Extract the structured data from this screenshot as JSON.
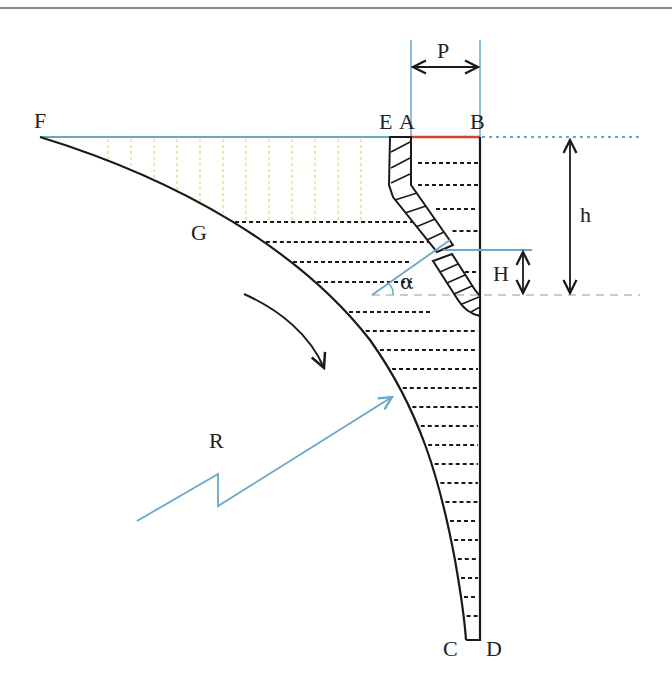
{
  "diagram": {
    "type": "engineering-cross-section",
    "labels": {
      "F": "F",
      "E": "E",
      "A": "A",
      "B": "B",
      "G": "G",
      "C": "C",
      "D": "D",
      "P": "P",
      "h": "h",
      "H": "H",
      "alpha": "α",
      "R": "R"
    },
    "colors": {
      "outline": "#1a1a1a",
      "blue_line": "#6aa6c8",
      "red_segment": "#d2442c",
      "yellow_hatch": "#f0d860",
      "dashed_gray": "#9a9a9a",
      "top_rule": "#8a8a8a"
    }
  }
}
